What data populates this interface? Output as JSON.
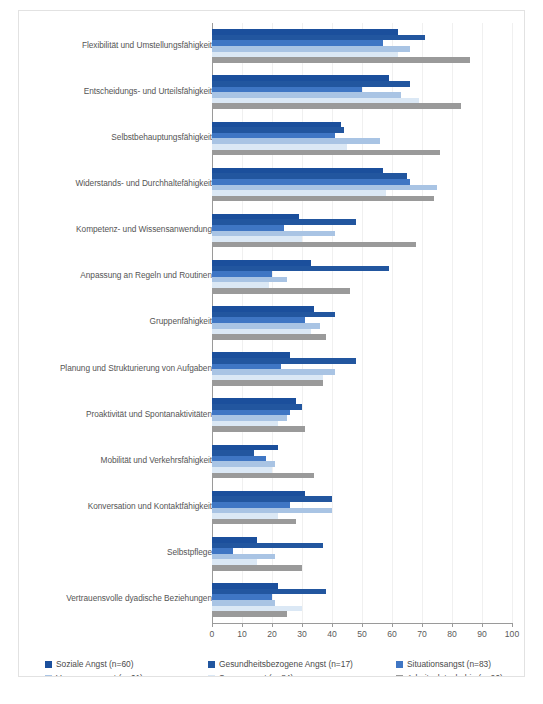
{
  "credit": "Fehlzeiten-Report 2023",
  "axis": {
    "ticks": [
      "0",
      "10",
      "20",
      "30",
      "40",
      "50",
      "60",
      "70",
      "80",
      "90",
      "100"
    ]
  },
  "legend": {
    "items": [
      {
        "label": "Soziale Angst (n=60)",
        "color": "#1b4f9c"
      },
      {
        "label": "Gesundheitsbezogene Angst (n=17)",
        "color": "#22569f"
      },
      {
        "label": "Situationsangst (n=83)",
        "color": "#3f76c4"
      },
      {
        "label": "Versagensangst (n=61)",
        "color": "#a9c4e4"
      },
      {
        "label": "Sorgenangst (n=84)",
        "color": "#dbe8f5"
      },
      {
        "label": "Arbeitsplatzphobie (n=26)",
        "color": "#9a9a9a"
      }
    ]
  },
  "chart_data": {
    "type": "bar",
    "orientation": "horizontal",
    "title": "",
    "xlabel": "",
    "ylabel": "",
    "xlim": [
      0,
      100
    ],
    "grid": true,
    "legend_position": "bottom",
    "categories": [
      "Flexibilität und Umstellungsfähigkeit",
      "Entscheidungs- und Urteilsfähigkeit",
      "Selbstbehauptungsfähigkeit",
      "Widerstands- und Durchhaltefähigkeit",
      "Kompetenz- und Wissensanwendung",
      "Anpassung an Regeln und Routinen",
      "Gruppenfähigkeit",
      "Planung und Strukturierung von Aufgaben",
      "Proaktivität und Spontanaktivitäten",
      "Mobilität und Verkehrsfähigkeit",
      "Konversation und Kontaktfähigkeit",
      "Selbstpflege",
      "Vertrauensvolle dyadische Beziehungen"
    ],
    "series": [
      {
        "name": "Soziale Angst (n=60)",
        "color": "#1b4f9c",
        "values": [
          62,
          59,
          43,
          57,
          29,
          33,
          34,
          26,
          28,
          22,
          31,
          15,
          22
        ]
      },
      {
        "name": "Gesundheitsbezogene Angst (n=17)",
        "color": "#22569f",
        "values": [
          71,
          66,
          44,
          65,
          48,
          59,
          41,
          48,
          30,
          14,
          40,
          37,
          38
        ]
      },
      {
        "name": "Situationsangst (n=83)",
        "color": "#3f76c4",
        "values": [
          57,
          50,
          41,
          66,
          24,
          20,
          31,
          23,
          26,
          18,
          26,
          7,
          20
        ]
      },
      {
        "name": "Versagensangst (n=61)",
        "color": "#a9c4e4",
        "values": [
          66,
          63,
          56,
          75,
          41,
          25,
          36,
          41,
          25,
          21,
          40,
          21,
          21
        ]
      },
      {
        "name": "Sorgenangst (n=84)",
        "color": "#dbe8f5",
        "values": [
          62,
          69,
          45,
          58,
          30,
          19,
          33,
          37,
          22,
          20,
          22,
          15,
          30
        ]
      },
      {
        "name": "Arbeitsplatzphobie (n=26)",
        "color": "#9a9a9a",
        "values": [
          86,
          83,
          76,
          74,
          68,
          46,
          38,
          37,
          31,
          34,
          28,
          30,
          25
        ]
      }
    ]
  }
}
